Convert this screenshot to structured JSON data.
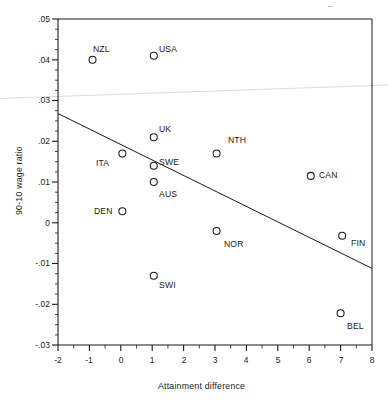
{
  "figure": {
    "background_color": "#ffffff",
    "ink_color": "#1a1a1a",
    "artifact_color": "#d8d8d8"
  },
  "chart_data": {
    "type": "scatter",
    "title": "",
    "xlabel": "Attainment difference",
    "ylabel": "90-10 wage ratio",
    "xlim": [
      -2,
      8
    ],
    "ylim": [
      -0.03,
      0.05
    ],
    "grid": false,
    "legend": null,
    "x_ticks": [
      -2,
      -1,
      0,
      1,
      2,
      3,
      4,
      5,
      6,
      7,
      8
    ],
    "x_tick_labels": [
      "-2",
      "-1",
      "0",
      "1",
      "2",
      "3",
      "4",
      "5",
      "6",
      "7",
      "8"
    ],
    "x_minor_tick_step": 0.5,
    "y_ticks": [
      0.05,
      0.04,
      0.03,
      0.02,
      0.01,
      0,
      -0.01,
      -0.02,
      -0.03
    ],
    "y_tick_labels": [
      ".05",
      ".04",
      ".03",
      ".02",
      ".01",
      "0",
      "-.01",
      "-.02",
      "-.03"
    ],
    "y_minor_tick_step": 0.0025,
    "marker": "open-circle",
    "points": [
      {
        "label": "NZL",
        "x": -0.9,
        "y": 0.04,
        "label_pos": "upper-right"
      },
      {
        "label": "USA",
        "x": 1.05,
        "y": 0.041,
        "label_pos": "right"
      },
      {
        "label": "UK",
        "x": 1.05,
        "y": 0.021,
        "label_pos": "upper-right"
      },
      {
        "label": "NTH",
        "x": 3.05,
        "y": 0.017,
        "label_pos": "upper-right"
      },
      {
        "label": "ITA",
        "x": 0.05,
        "y": 0.017,
        "label_pos": "lower-left"
      },
      {
        "label": "SWE",
        "x": 1.05,
        "y": 0.014,
        "label_pos": "right"
      },
      {
        "label": "CAN",
        "x": 6.05,
        "y": 0.0115,
        "label_pos": "right"
      },
      {
        "label": "AUS",
        "x": 1.05,
        "y": 0.01,
        "label_pos": "lower-right"
      },
      {
        "label": "DEN",
        "x": 0.05,
        "y": 0.0028,
        "label_pos": "left"
      },
      {
        "label": "NOR",
        "x": 3.05,
        "y": -0.002,
        "label_pos": "lower-right"
      },
      {
        "label": "FIN",
        "x": 7.05,
        "y": -0.0032,
        "label_pos": "lower-right"
      },
      {
        "label": "SWI",
        "x": 1.05,
        "y": -0.013,
        "label_pos": "lower-right"
      },
      {
        "label": "BEL",
        "x": 7.0,
        "y": -0.0222,
        "label_pos": "lower-right"
      }
    ],
    "fit_line": {
      "type": "linear-regression",
      "x_start": -2,
      "y_start": 0.0268,
      "x_end": 8,
      "y_end": -0.0112
    },
    "artifact_line": {
      "description": "faint light-gray scan artifact streak",
      "x_start": -2,
      "y_start": 0.0305,
      "x_end": 8,
      "y_end": 0.0338
    }
  }
}
